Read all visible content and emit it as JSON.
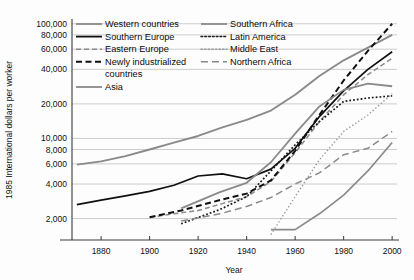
{
  "chart_data": {
    "type": "line",
    "title": "",
    "xlabel": "Year",
    "ylabel": "1985 International dollars per worker",
    "xlim": [
      1868,
      2002
    ],
    "ylim": [
      1300,
      110000
    ],
    "yscale": "log",
    "grid": true,
    "legend_position": "top-inside",
    "xticks": [
      1880,
      1900,
      1920,
      1940,
      1960,
      1980,
      2000
    ],
    "xtick_labels": [
      "1880",
      "1900",
      "1920",
      "1940",
      "1960",
      "1980",
      "2000"
    ],
    "yticks": [
      2000,
      4000,
      6000,
      8000,
      10000,
      20000,
      40000,
      60000,
      80000,
      100000
    ],
    "ytick_labels": [
      "2,000",
      "4,000",
      "6,000",
      "8,000",
      "10,000",
      "20,000",
      "40,000",
      "60,000",
      "80,000",
      "100,000"
    ],
    "series": [
      {
        "name": "Western countries",
        "style": "solid",
        "color": "#8a8a8a",
        "width": 1.9,
        "x": [
          1870,
          1880,
          1890,
          1900,
          1910,
          1920,
          1930,
          1940,
          1950,
          1960,
          1970,
          1980,
          1990,
          2000
        ],
        "values": [
          5900,
          6300,
          7000,
          8000,
          9200,
          10500,
          12500,
          14500,
          17500,
          24000,
          35000,
          48000,
          62000,
          80000
        ]
      },
      {
        "name": "Southern Europe",
        "style": "solid",
        "color": "#101010",
        "width": 1.7,
        "x": [
          1870,
          1880,
          1890,
          1900,
          1910,
          1920,
          1930,
          1940,
          1950,
          1960,
          1970,
          1980,
          1990,
          2000
        ],
        "values": [
          2650,
          2900,
          3150,
          3450,
          3900,
          4700,
          4900,
          4450,
          5400,
          8200,
          15500,
          26000,
          40000,
          57000
        ]
      },
      {
        "name": "Eastern Europe",
        "style": "dashed",
        "color": "#8a8a8a",
        "width": 1.5,
        "x": [
          1900,
          1910,
          1920,
          1930,
          1940,
          1950,
          1960,
          1970,
          1980,
          1990,
          2000
        ],
        "values": [
          2050,
          2200,
          2350,
          2700,
          3100,
          4200,
          7500,
          14000,
          24000,
          36000,
          50000
        ]
      },
      {
        "name": "Newly industrialized countries",
        "style": "dashed-bold",
        "color": "#101010",
        "width": 2.0,
        "x": [
          1900,
          1913,
          1929,
          1940,
          1950,
          1960,
          1970,
          1980,
          1990,
          2000
        ],
        "values": [
          2050,
          2350,
          2900,
          3300,
          4300,
          7800,
          16000,
          32000,
          58000,
          100000
        ]
      },
      {
        "name": "Asia",
        "style": "solid",
        "color": "#8a8a8a",
        "width": 1.7,
        "x": [
          1950,
          1960,
          1970,
          1980,
          1990,
          2000
        ],
        "values": [
          1600,
          1600,
          2200,
          3200,
          5200,
          9200
        ]
      },
      {
        "name": "Southern Africa",
        "style": "solid",
        "color": "#8a8a8a",
        "width": 1.8,
        "x": [
          1913,
          1929,
          1940,
          1950,
          1960,
          1970,
          1980,
          1990,
          2000
        ],
        "values": [
          2450,
          3400,
          4100,
          6200,
          11000,
          19000,
          26500,
          30000,
          28500
        ]
      },
      {
        "name": "Latin America",
        "style": "dotted-bold",
        "color": "#1a1a1a",
        "width": 1.7,
        "x": [
          1913,
          1929,
          1940,
          1950,
          1960,
          1970,
          1980,
          1990,
          2000
        ],
        "values": [
          1800,
          2400,
          3100,
          5200,
          8800,
          14000,
          21000,
          22500,
          23500
        ]
      },
      {
        "name": "Middle East",
        "style": "dotted",
        "color": "#9a9a9a",
        "width": 1.4,
        "x": [
          1950,
          1960,
          1970,
          1980,
          1990,
          2000
        ],
        "values": [
          1450,
          3100,
          6500,
          11500,
          16000,
          24500
        ]
      },
      {
        "name": "Northern Africa",
        "style": "dashed-long",
        "color": "#8a8a8a",
        "width": 1.5,
        "x": [
          1913,
          1929,
          1940,
          1950,
          1960,
          1970,
          1980,
          1990,
          2000
        ],
        "values": [
          1900,
          2200,
          2550,
          3050,
          4000,
          5000,
          7200,
          8200,
          11500
        ]
      }
    ]
  },
  "axes": {
    "ylabel": "1985 International dollars per worker",
    "xlabel": "Year",
    "ytick_labels": [
      "100,000",
      "80,000",
      "60,000",
      "40,000",
      "20,000",
      "10,000",
      "8,000",
      "6,000",
      "4,000",
      "2,000"
    ],
    "xtick_labels": [
      "1880",
      "1900",
      "1920",
      "1940",
      "1960",
      "1980",
      "2000"
    ]
  },
  "legend": {
    "left_column": [
      {
        "label": "Western countries",
        "style": "solid",
        "color": "#8a8a8a"
      },
      {
        "label": "Southern Europe",
        "style": "solid",
        "color": "#101010"
      },
      {
        "label": "Eastern Europe",
        "style": "dashed",
        "color": "#8a8a8a"
      },
      {
        "label": "Newly industrialized",
        "style": "dashed-bold",
        "color": "#101010"
      },
      {
        "label": "countries",
        "style": "none",
        "color": "#101010"
      },
      {
        "label": "Asia",
        "style": "solid",
        "color": "#8a8a8a"
      }
    ],
    "right_column": [
      {
        "label": "Southern Africa",
        "style": "solid",
        "color": "#8a8a8a"
      },
      {
        "label": "Latin America",
        "style": "dotted-bold",
        "color": "#1a1a1a"
      },
      {
        "label": "Middle East",
        "style": "dotted",
        "color": "#9a9a9a"
      },
      {
        "label": "Northern Africa",
        "style": "dashed-long",
        "color": "#8a8a8a"
      }
    ]
  }
}
